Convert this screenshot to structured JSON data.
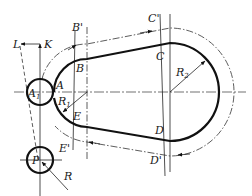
{
  "diagram": {
    "colors": {
      "stroke": "#111111",
      "background": "#ffffff"
    },
    "labels": {
      "L": "L",
      "K": "K",
      "B_prime": "B'",
      "C_prime": "C'",
      "B": "B",
      "C": "C",
      "A": "A",
      "A1": "A",
      "A1_sub": "1",
      "R1": "R",
      "R1_sub": "1",
      "R2": "R",
      "R2_sub": "2",
      "E": "E",
      "D": "D",
      "E_prime": "E'",
      "D_prime": "D'",
      "P": "P",
      "R": "R"
    }
  }
}
